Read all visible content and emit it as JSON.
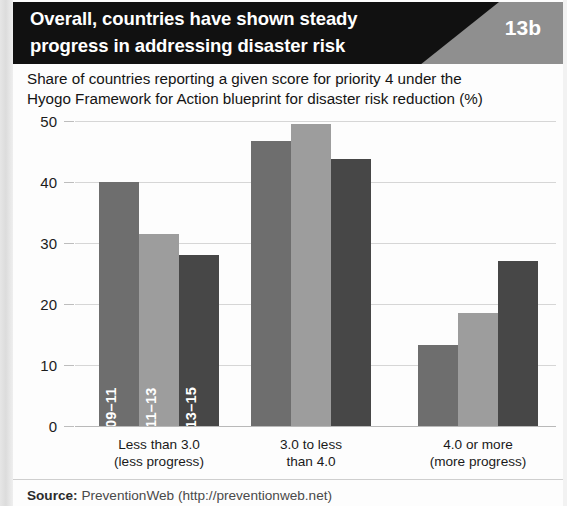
{
  "header": {
    "title_line1": "Overall, countries have shown steady",
    "title_line2": "progress in addressing disaster risk",
    "badge": "13b"
  },
  "subtitle": {
    "line1": "Share of countries reporting a given score for priority 4 under the",
    "line2": "Hyogo Framework for Action blueprint for disaster risk reduction (%)"
  },
  "footer": {
    "source_label": "Source:",
    "source_text": "PreventionWeb (http://preventionweb.net)"
  },
  "chart_data": {
    "type": "bar",
    "title": "Overall, countries have shown steady progress in addressing disaster risk",
    "subtitle": "Share of countries reporting a given score for priority 4 under the Hyogo Framework for Action blueprint for disaster risk reduction (%)",
    "xlabel": "",
    "ylabel": "",
    "ylim": [
      0,
      50
    ],
    "yticks": [
      0,
      10,
      20,
      30,
      40,
      50
    ],
    "ytick_labels": [
      "0",
      "10",
      "20",
      "30",
      "40",
      "50"
    ],
    "grid": true,
    "legend": "in-bar rotated labels",
    "categories": [
      "Less than 3.0\n(less progress)",
      "3.0 to less\nthan 4.0",
      "4.0 or more\n(more progress)"
    ],
    "category_lines": [
      [
        "Less than 3.0",
        "(less progress)"
      ],
      [
        "3.0 to less",
        "than 4.0"
      ],
      [
        "4.0 or more",
        "(more progress)"
      ]
    ],
    "series": [
      {
        "name": "2009–11",
        "color": "#6e6e6e",
        "values": [
          40.0,
          46.8,
          13.2
        ]
      },
      {
        "name": "2011–13",
        "color": "#9d9d9d",
        "values": [
          31.5,
          49.5,
          18.5
        ]
      },
      {
        "name": "2013–15",
        "color": "#474747",
        "values": [
          28.0,
          43.8,
          27.0
        ]
      }
    ]
  }
}
